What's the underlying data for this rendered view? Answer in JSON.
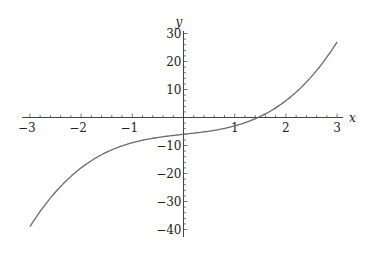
{
  "chart_data": {
    "type": "line",
    "title": "",
    "xlabel": "x",
    "ylabel": "y",
    "function": "y = x^3 + 2x - 6",
    "xlim": [
      -3,
      3
    ],
    "ylim": [
      -40,
      30
    ],
    "grid": false,
    "legend": null,
    "x_ticks": [
      -3,
      -2,
      -1,
      1,
      2,
      3
    ],
    "x_tick_labels": [
      "−3",
      "−2",
      "−1",
      "1",
      "2",
      "3"
    ],
    "y_ticks": [
      30,
      20,
      10,
      -10,
      -20,
      -30,
      -40
    ],
    "y_tick_labels": [
      "30",
      "20",
      "10",
      "−10",
      "−20",
      "−30",
      "−40"
    ],
    "x_minor_step": 0.2,
    "y_minor_step": 2,
    "series": [
      {
        "name": "f(x)",
        "color": "#6a6a6a",
        "x": [
          -3,
          -2.5,
          -2,
          -1.5,
          -1,
          -0.5,
          0,
          0.5,
          1,
          1.43,
          1.5,
          2,
          2.5,
          3
        ],
        "y": [
          -39,
          -26.6,
          -18,
          -12.4,
          -9,
          -7.1,
          -6,
          -4.9,
          -3,
          0,
          0.4,
          6,
          14.6,
          27
        ]
      }
    ]
  },
  "axes": {
    "x_label": "x",
    "y_label": "y",
    "color": "#444444"
  }
}
